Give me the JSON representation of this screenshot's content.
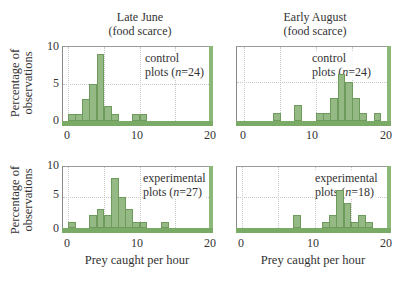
{
  "columns": [
    {
      "title_line1": "Late June",
      "title_line2": "(food scarce)"
    },
    {
      "title_line1": "Early August",
      "title_line2": "(food scarce)"
    }
  ],
  "ylabel_line1": "Percentage of",
  "ylabel_line2": "observations",
  "xlabel": "Prey caught per hour",
  "yticks": [
    "10",
    "5",
    "0"
  ],
  "xticks": [
    "0",
    "10",
    "20"
  ],
  "colors": {
    "bar_fill": "#94b984",
    "bar_edge": "#6e9a5c",
    "frame_accent": "#7aab66"
  },
  "panels": [
    {
      "legend_line1": "control",
      "legend_line2_pre": "plots (",
      "legend_n": "n",
      "legend_line2_post": "=24)"
    },
    {
      "legend_line1": "control",
      "legend_line2_pre": "plots (",
      "legend_n": "n",
      "legend_line2_post": "=24)"
    },
    {
      "legend_line1": "experimental",
      "legend_line2_pre": "plots (",
      "legend_n": "n",
      "legend_line2_post": "=27)"
    },
    {
      "legend_line1": "experimental",
      "legend_line2_pre": "plots (",
      "legend_n": "n",
      "legend_line2_post": "=18)"
    }
  ],
  "chart_data": [
    {
      "type": "bar",
      "title": "Late June (food scarce) — control plots (n=24)",
      "xlabel": "Prey caught per hour",
      "ylabel": "Percentage of observations",
      "xlim": [
        0,
        20
      ],
      "ylim": [
        0,
        10
      ],
      "xticks": [
        0,
        10,
        20
      ],
      "yticks": [
        0,
        5,
        10
      ],
      "grid": true,
      "bin_width": 1,
      "bins": [
        [
          0,
          1
        ],
        [
          1,
          1
        ],
        [
          2,
          3
        ],
        [
          3,
          5
        ],
        [
          4,
          9
        ],
        [
          5,
          2
        ],
        [
          6,
          1
        ],
        [
          9,
          1
        ],
        [
          10,
          1
        ]
      ]
    },
    {
      "type": "bar",
      "title": "Early August (food scarce) — control plots (n=24)",
      "xlabel": "Prey caught per hour",
      "ylabel": "Percentage of observations",
      "xlim": [
        0,
        20
      ],
      "ylim": [
        0,
        10
      ],
      "xticks": [
        0,
        10,
        20
      ],
      "yticks": [
        0,
        5,
        10
      ],
      "grid": true,
      "bin_width": 1,
      "bins": [
        [
          4,
          1
        ],
        [
          7,
          2
        ],
        [
          10,
          1
        ],
        [
          11,
          1
        ],
        [
          12,
          3
        ],
        [
          13,
          6
        ],
        [
          14,
          5
        ],
        [
          15,
          3
        ],
        [
          16,
          1
        ],
        [
          18,
          1
        ]
      ]
    },
    {
      "type": "bar",
      "title": "Late June (food scarce) — experimental plots (n=27)",
      "xlabel": "Prey caught per hour",
      "ylabel": "Percentage of observations",
      "xlim": [
        0,
        20
      ],
      "ylim": [
        0,
        10
      ],
      "xticks": [
        0,
        10,
        20
      ],
      "yticks": [
        0,
        5,
        10
      ],
      "grid": true,
      "bin_width": 1,
      "bins": [
        [
          0,
          1
        ],
        [
          3,
          2
        ],
        [
          4,
          3
        ],
        [
          5,
          2
        ],
        [
          6,
          8
        ],
        [
          7,
          5
        ],
        [
          8,
          3
        ],
        [
          9,
          1
        ],
        [
          10,
          1
        ],
        [
          13,
          1
        ]
      ]
    },
    {
      "type": "bar",
      "title": "Early August (food scarce) — experimental plots (n=18)",
      "xlabel": "Prey caught per hour",
      "ylabel": "Percentage of observations",
      "xlim": [
        0,
        20
      ],
      "ylim": [
        0,
        10
      ],
      "xticks": [
        0,
        10,
        20
      ],
      "yticks": [
        0,
        5,
        10
      ],
      "grid": true,
      "bin_width": 1,
      "bins": [
        [
          7,
          2
        ],
        [
          11,
          1
        ],
        [
          12,
          2
        ],
        [
          13,
          6
        ],
        [
          14,
          4
        ],
        [
          15,
          1
        ],
        [
          16,
          2
        ],
        [
          17,
          1
        ]
      ]
    }
  ]
}
